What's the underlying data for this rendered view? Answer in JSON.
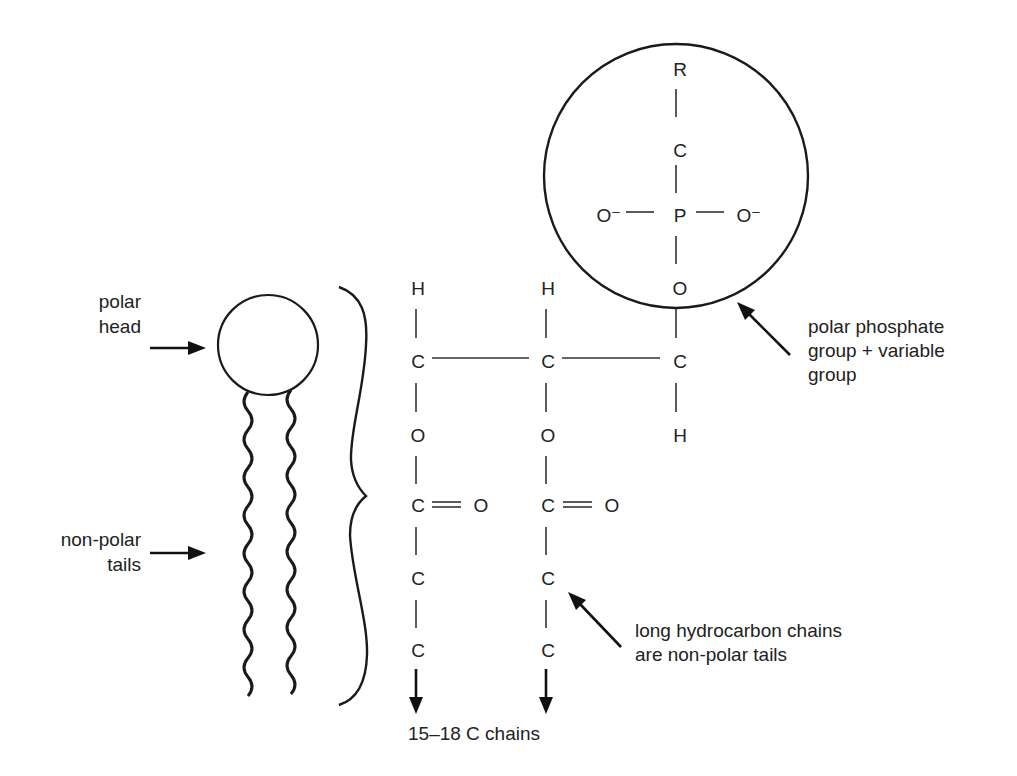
{
  "diagram": {
    "type": "phospholipid-structure",
    "schematic": {
      "labels": {
        "polar_head": [
          "polar",
          "head"
        ],
        "nonpolar_tails": [
          "non-polar",
          "tails"
        ]
      }
    },
    "structure": {
      "glycerol_columns": [
        {
          "atoms": [
            "H",
            "C",
            "O",
            "C",
            "O",
            "C",
            "C"
          ],
          "carbonyl_o": "O"
        },
        {
          "atoms": [
            "H",
            "C",
            "O",
            "C",
            "O",
            "C",
            "C"
          ],
          "carbonyl_o": "O"
        },
        {
          "atoms": [
            "O",
            "C",
            "H"
          ]
        }
      ],
      "phosphate_group": {
        "atoms": [
          "R",
          "C",
          "P"
        ],
        "left_o": "O⁻",
        "right_o": "O⁻"
      },
      "chain_label": "15–18 C chains"
    },
    "annotations": {
      "phosphate": [
        "polar phosphate",
        "group + variable",
        "group"
      ],
      "hydrocarbon": [
        "long hydrocarbon chains",
        "are non-polar tails"
      ]
    },
    "colors": {
      "ink": "#222222",
      "background": "#ffffff"
    }
  }
}
